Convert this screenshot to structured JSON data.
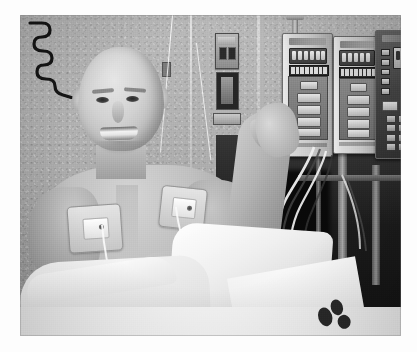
{
  "image": {
    "kind": "photograph",
    "medium": "grayscale-photograph",
    "caption": "Smiling bald male patient propped up in a hospital bed, bare chest with two adhesive telemetry electrode pads, holding up IV tubing next to a pole of three infusion pumps",
    "setting": "hospital patient room",
    "orientation": "landscape",
    "border": "white scan margin around the photograph"
  },
  "scene": {
    "background": {
      "wall_name": "hospital-room-wall",
      "wall_tone": "#b3b2ae",
      "dark_area_name": "darkened-room-corner",
      "dark_tone": "#211f1e",
      "wall_items": [
        {
          "name": "coiled-call-button-cable",
          "description": "black spiral cord hanging on the wall behind the patient"
        },
        {
          "name": "medical-gas-outlet-upper",
          "description": "wall plate with two dark port slots"
        },
        {
          "name": "medical-gas-outlet-lower",
          "description": "recessed dark suction/oxygen outlet"
        },
        {
          "name": "wall-plate-strip",
          "description": "small narrow wall plate below the outlets"
        },
        {
          "name": "wall-switch",
          "description": "small switch plate left of the outlets"
        },
        {
          "name": "iv-drip-line",
          "description": "thin clear IV line descending from above"
        }
      ]
    },
    "patient": {
      "name": "patient",
      "pose": "reclined, smiling, left arm raised holding tubing, right hand in a fist at chest level",
      "expression": "smiling",
      "hair": "bald",
      "upper_body": "bare chest",
      "features": [
        {
          "name": "electrode-pad-left-chest",
          "label": "adhesive telemetry electrode pad"
        },
        {
          "name": "electrode-pad-right-chest",
          "label": "adhesive telemetry electrode pad"
        },
        {
          "name": "lead-wire",
          "label": "white ECG lead wire"
        },
        {
          "name": "hospital-wristband",
          "label": "patient ID wristband"
        }
      ]
    },
    "equipment": {
      "pole_name": "iv-pole",
      "pumps": [
        {
          "name": "infusion-pump-1",
          "face": "light",
          "display": "segment-readout",
          "controls": "soft keys"
        },
        {
          "name": "infusion-pump-2",
          "face": "light",
          "display": "segment-readout",
          "controls": "soft keys"
        },
        {
          "name": "infusion-pump-3",
          "face": "dark",
          "display": "segment-readout",
          "controls": "numeric keypad"
        }
      ],
      "tubing_name": "iv-tubing-bundle",
      "bed_rail_name": "bed-side-rail"
    },
    "bedding": {
      "sheet_name": "bed-sheet",
      "gown_name": "hospital-gown",
      "sheet_tone": "#f4f2ee",
      "printed_motif": "dark paw-print style pattern on the sheet near the lower right"
    }
  },
  "palette": {
    "wall": "#b3b2ae",
    "skin": "#c6bdb2",
    "linen": "#f4f2ee",
    "shadow": "#211f1e",
    "metal": "#9a9894",
    "page": "#fdfdfd"
  }
}
